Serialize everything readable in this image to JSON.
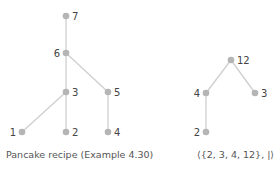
{
  "diagrams": [
    {
      "caption": "Pancake recipe (Example 4.30)",
      "nodes": [
        {
          "id": "7",
          "label": "7",
          "x": 66,
          "y": 16,
          "label_side": "right"
        },
        {
          "id": "6",
          "label": "6",
          "x": 66,
          "y": 53,
          "label_side": "left"
        },
        {
          "id": "3",
          "label": "3",
          "x": 66,
          "y": 92,
          "label_side": "right"
        },
        {
          "id": "5",
          "label": "5",
          "x": 108,
          "y": 92,
          "label_side": "right"
        },
        {
          "id": "1",
          "label": "1",
          "x": 22,
          "y": 132,
          "label_side": "left"
        },
        {
          "id": "2",
          "label": "2",
          "x": 66,
          "y": 132,
          "label_side": "right"
        },
        {
          "id": "4",
          "label": "4",
          "x": 108,
          "y": 132,
          "label_side": "right"
        }
      ],
      "edges": [
        [
          "7",
          "6"
        ],
        [
          "6",
          "3"
        ],
        [
          "6",
          "5"
        ],
        [
          "3",
          "1"
        ],
        [
          "3",
          "2"
        ],
        [
          "5",
          "4"
        ]
      ]
    },
    {
      "caption": "⟨{2, 3, 4, 12}, |⟩",
      "nodes": [
        {
          "id": "12",
          "label": "12",
          "x": 231,
          "y": 60,
          "label_side": "right"
        },
        {
          "id": "4",
          "label": "4",
          "x": 206,
          "y": 93,
          "label_side": "left"
        },
        {
          "id": "3",
          "label": "3",
          "x": 255,
          "y": 93,
          "label_side": "right"
        },
        {
          "id": "2",
          "label": "2",
          "x": 206,
          "y": 132,
          "label_side": "left"
        }
      ],
      "edges": [
        [
          "12",
          "4"
        ],
        [
          "12",
          "3"
        ],
        [
          "4",
          "2"
        ]
      ]
    }
  ],
  "colors": {
    "node": "#b5b5b5",
    "edge": "#cfcfcf",
    "label": "#444444"
  }
}
